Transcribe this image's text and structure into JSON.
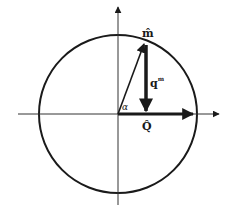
{
  "diagram": {
    "type": "vector-diagram",
    "labels": {
      "m_hat": "m̂",
      "q_m": "q",
      "q_m_superscript": "m",
      "alpha": "α",
      "Q_hat": "Q̂"
    },
    "geometry": {
      "origin": [
        118,
        114
      ],
      "circle_radius": 79,
      "m_hat_tip": [
        144,
        43
      ],
      "q_m_start": [
        146,
        44
      ],
      "q_m_end": [
        146,
        111
      ],
      "Q_hat_tip": [
        193,
        114
      ]
    },
    "colors": {
      "stroke": "#1a1a1a",
      "axis": "#333333",
      "background": "#ffffff"
    }
  }
}
